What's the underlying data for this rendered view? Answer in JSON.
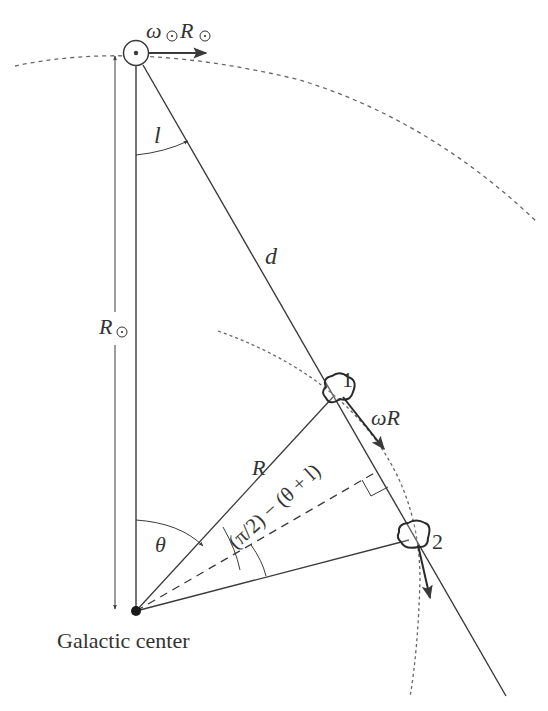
{
  "figure": {
    "type": "galactic-rotation-geometry",
    "labels": {
      "sun_velocity_omega": "ω",
      "sun_velocity_R": "R",
      "longitude_angle": "l",
      "distance": "d",
      "sun_distance_R": "R",
      "star1": "1",
      "star2": "2",
      "star_velocity": "ωR",
      "radius": "R",
      "angle_expression": "(π/2) − (θ + l)",
      "theta": "θ",
      "galactic_center": "Galactic center"
    },
    "colors": {
      "line": "#3a3a3a",
      "dashed": "#555555",
      "text": "#333333",
      "background": "#ffffff"
    }
  }
}
